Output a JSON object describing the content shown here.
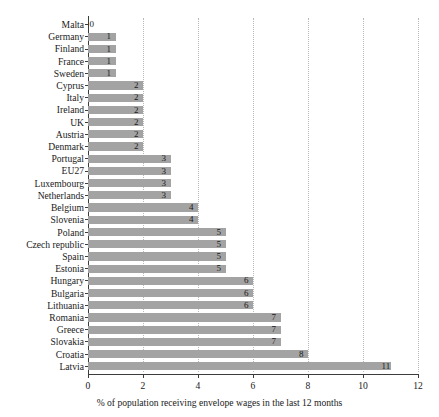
{
  "chart_data": {
    "type": "bar",
    "orientation": "horizontal",
    "title": "",
    "xlabel": "% of population receiving envelope wages in the last 12 months",
    "ylabel": "",
    "xlim": [
      0,
      12
    ],
    "xticks": [
      0,
      2,
      4,
      6,
      8,
      10,
      12
    ],
    "grid": "vertical-dotted",
    "legend": "none",
    "bar_color": "#a3a3a3",
    "categories": [
      "Malta",
      "Germany",
      "Finland",
      "France",
      "Sweden",
      "Cyprus",
      "Italy",
      "Ireland",
      "UK",
      "Austria",
      "Denmark",
      "Portugal",
      "EU27",
      "Luxembourg",
      "Netherlands",
      "Belgium",
      "Slovenia",
      "Poland",
      "Czech republic",
      "Spain",
      "Estonia",
      "Hungary",
      "Bulgaria",
      "Lithuania",
      "Romania",
      "Greece",
      "Slovakia",
      "Croatia",
      "Latvia"
    ],
    "values": [
      0,
      1,
      1,
      1,
      1,
      2,
      2,
      2,
      2,
      2,
      2,
      3,
      3,
      3,
      3,
      4,
      4,
      5,
      5,
      5,
      5,
      6,
      6,
      6,
      7,
      7,
      7,
      8,
      11
    ],
    "data_labels": [
      "0",
      "1",
      "1",
      "1",
      "1",
      "2",
      "2",
      "2",
      "2",
      "2",
      "2",
      "3",
      "3",
      "3",
      "3",
      "4",
      "4",
      "5",
      "5",
      "5",
      "5",
      "6",
      "6",
      "6",
      "7",
      "7",
      "7",
      "8",
      "11"
    ]
  }
}
